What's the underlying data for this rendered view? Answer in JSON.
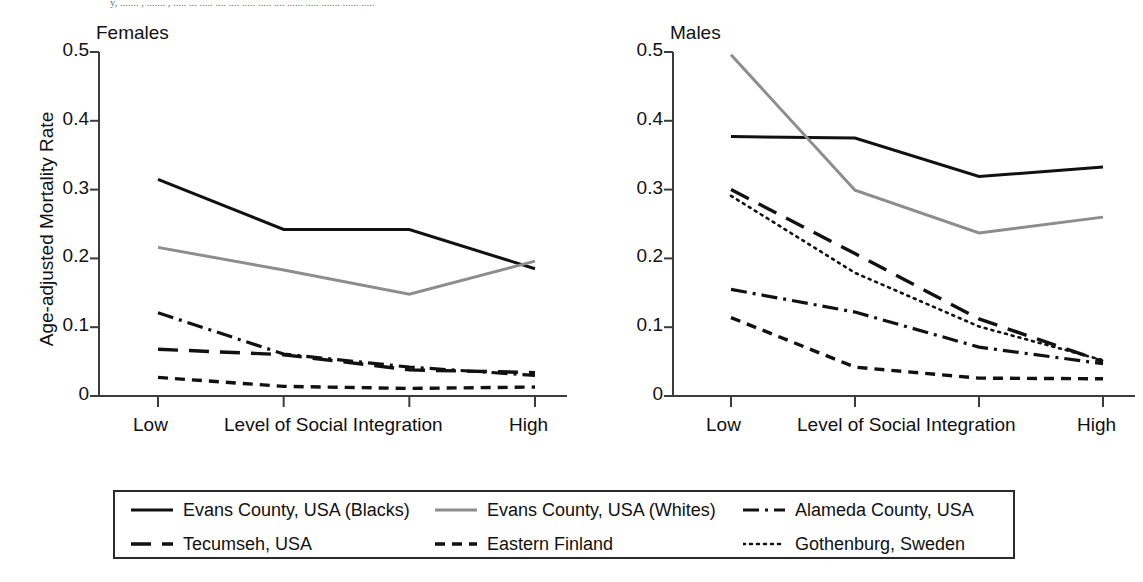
{
  "page": {
    "header_text": "y, ....... , ....... , ..... ... ..... .... .... ..... ..... .... ...... ..... ....... ...... .....",
    "ylabel": "Age-adjusted Mortality Rate",
    "xlabel": "Level of Social Integration",
    "x_low_label": "Low",
    "x_high_label": "High"
  },
  "colors": {
    "black": "#111111",
    "gray": "#8d8d8d",
    "axis": "#3c3c3c",
    "background": "#ffffff"
  },
  "panels": [
    {
      "title": "Females",
      "id": "females"
    },
    {
      "title": "Males",
      "id": "males"
    }
  ],
  "legend": {
    "rows": [
      [
        {
          "label": "Evans County, USA (Blacks)",
          "style": "solid",
          "color": "#111111",
          "icon": "solid-line-swatch"
        },
        {
          "label": "Evans County, USA (Whites)",
          "style": "solid",
          "color": "#8d8d8d",
          "icon": "solid-gray-line-swatch"
        },
        {
          "label": "Alameda County, USA",
          "style": "dashdot",
          "color": "#111111",
          "icon": "dash-dot-line-swatch"
        }
      ],
      [
        {
          "label": "Tecumseh, USA",
          "style": "longdash",
          "color": "#111111",
          "icon": "long-dash-line-swatch"
        },
        {
          "label": "Eastern Finland",
          "style": "dash",
          "color": "#111111",
          "icon": "short-dash-line-swatch"
        },
        {
          "label": "Gothenburg, Sweden",
          "style": "dotted",
          "color": "#111111",
          "icon": "dotted-line-swatch"
        }
      ]
    ]
  },
  "chart_data": [
    {
      "type": "line",
      "title": "Females",
      "xlabel": "Level of Social Integration",
      "ylabel": "Age-adjusted Mortality Rate",
      "categories": [
        "Low",
        "",
        "",
        "High"
      ],
      "x_tick_labels": [
        "Low",
        "High"
      ],
      "yticks": [
        "0",
        "0.1",
        "0.2",
        "0.3",
        "0.4",
        "0.5"
      ],
      "ylim": [
        0,
        0.5
      ],
      "grid": false,
      "legend_position": "below-figure",
      "series": [
        {
          "name": "Evans County, USA (Blacks)",
          "style": "solid",
          "color": "#111111",
          "values": [
            0.315,
            0.242,
            0.242,
            0.185
          ]
        },
        {
          "name": "Evans County, USA (Whites)",
          "style": "solid",
          "color": "#8d8d8d",
          "values": [
            0.216,
            0.183,
            0.148,
            0.196
          ]
        },
        {
          "name": "Alameda County, USA",
          "style": "dashdot",
          "color": "#111111",
          "values": [
            0.121,
            0.061,
            0.042,
            0.03
          ]
        },
        {
          "name": "Tecumseh, USA",
          "style": "longdash",
          "color": "#111111",
          "values": [
            0.068,
            0.06,
            0.038,
            0.034
          ]
        },
        {
          "name": "Eastern Finland",
          "style": "dash",
          "color": "#111111",
          "values": [
            0.027,
            0.014,
            0.011,
            0.013
          ]
        },
        {
          "name": "Gothenburg, Sweden",
          "style": "dotted",
          "color": "#111111",
          "values": []
        }
      ]
    },
    {
      "type": "line",
      "title": "Males",
      "xlabel": "Level of Social Integration",
      "ylabel": "Age-adjusted Mortality Rate",
      "categories": [
        "Low",
        "",
        "",
        "High"
      ],
      "x_tick_labels": [
        "Low",
        "High"
      ],
      "yticks": [
        "0",
        "0.1",
        "0.2",
        "0.3",
        "0.4",
        "0.5"
      ],
      "ylim": [
        0,
        0.5
      ],
      "grid": false,
      "legend_position": "below-figure",
      "series": [
        {
          "name": "Evans County, USA (Blacks)",
          "style": "solid",
          "color": "#111111",
          "values": [
            0.377,
            0.375,
            0.319,
            0.333
          ]
        },
        {
          "name": "Evans County, USA (Whites)",
          "style": "solid",
          "color": "#8d8d8d",
          "values": [
            0.496,
            0.299,
            0.237,
            0.26
          ]
        },
        {
          "name": "Tecumseh, USA",
          "style": "longdash",
          "color": "#111111",
          "values": [
            0.3,
            0.207,
            0.112,
            0.05
          ]
        },
        {
          "name": "Gothenburg, Sweden",
          "style": "dotted",
          "color": "#111111",
          "values": [
            0.291,
            0.179,
            0.101,
            0.052
          ]
        },
        {
          "name": "Alameda County, USA",
          "style": "dashdot",
          "color": "#111111",
          "values": [
            0.155,
            0.122,
            0.071,
            0.047
          ]
        },
        {
          "name": "Eastern Finland",
          "style": "dash",
          "color": "#111111",
          "values": [
            0.114,
            0.042,
            0.026,
            0.025
          ]
        }
      ]
    }
  ]
}
